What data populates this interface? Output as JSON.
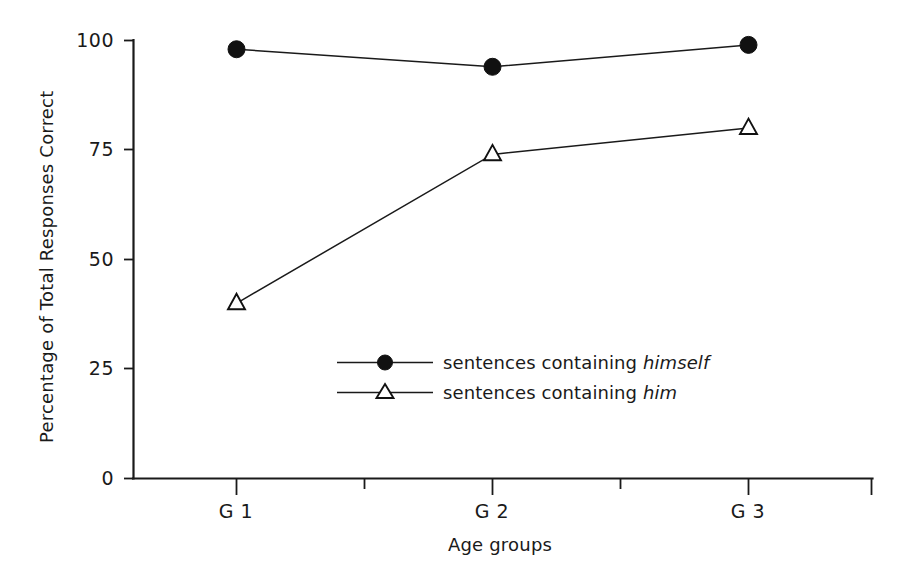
{
  "chart_data": {
    "type": "line",
    "title": "",
    "subtitle": "",
    "xlabel": "Age groups",
    "ylabel": "Percentage of Total Responses Correct",
    "categories": [
      "G 1",
      "G 2",
      "G 3"
    ],
    "xtick_labels": [
      "G 1",
      "",
      "G 2",
      "",
      "G 3",
      ""
    ],
    "xtick_count": 6,
    "ytick_labels": [
      "0",
      "25",
      "50",
      "75",
      "100"
    ],
    "ytick_values": [
      0,
      25,
      50,
      75,
      100
    ],
    "ylim": [
      0,
      100
    ],
    "grid": false,
    "legend_position": "center",
    "series": [
      {
        "name": "sentences containing himself",
        "name_plain": "sentences containing",
        "name_emphasis": "himself",
        "marker": "filled-circle",
        "color": "#111111",
        "values": [
          98,
          94,
          99
        ]
      },
      {
        "name": "sentences containing him",
        "name_plain": "sentences containing",
        "name_emphasis": "him",
        "marker": "open-triangle",
        "color": "#111111",
        "values": [
          40,
          74,
          80
        ]
      }
    ]
  },
  "figure": {
    "background_color": "#ffffff",
    "axis_color": "#1a1a1a"
  }
}
